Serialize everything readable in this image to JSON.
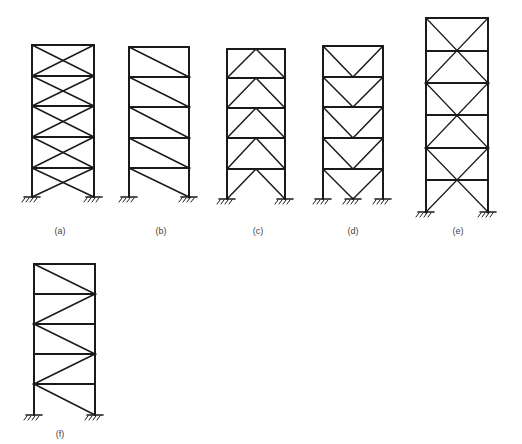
{
  "figure": {
    "stroke_color": "#1a1a1a",
    "label_color": "#444444",
    "frames": [
      {
        "id": "a",
        "label": "(a)",
        "bracing": "x-brace (cross) every story",
        "left_x": 32,
        "right_x": 94,
        "levels_y": [
          45,
          76,
          106,
          137,
          168,
          197
        ],
        "supports_x": [
          32,
          94
        ],
        "label_pos": [
          60,
          234
        ]
      },
      {
        "id": "b",
        "label": "(b)",
        "bracing": "single diagonal every story (top-left to bottom-right)",
        "left_x": 129,
        "right_x": 189,
        "levels_y": [
          47,
          77,
          107,
          138,
          168,
          197
        ],
        "supports_x": [
          129,
          189
        ],
        "label_pos": [
          161,
          234
        ]
      },
      {
        "id": "c",
        "label": "(c)",
        "bracing": "inverted-V (chevron) every story",
        "left_x": 227,
        "right_x": 285,
        "levels_y": [
          49,
          78,
          108,
          138,
          169,
          199
        ],
        "supports_x": [
          227,
          285
        ],
        "label_pos": [
          258,
          234
        ]
      },
      {
        "id": "d",
        "label": "(d)",
        "bracing": "V-brace in upper stories, inverted-V in bottom story",
        "left_x": 323,
        "right_x": 383,
        "levels_y": [
          46,
          77,
          107,
          138,
          169,
          199
        ],
        "supports_x": [
          323,
          353,
          383
        ],
        "label_pos": [
          353,
          234
        ]
      },
      {
        "id": "e",
        "label": "(e)",
        "bracing": "two-story X-brace",
        "left_x": 426,
        "right_x": 488,
        "levels_y": [
          18,
          51,
          83,
          115,
          148,
          180,
          212
        ],
        "supports_x": [
          426,
          488
        ],
        "label_pos": [
          458,
          234
        ]
      },
      {
        "id": "f",
        "label": "(f)",
        "bracing": "zig-zag single diagonals",
        "left_x": 34,
        "right_x": 95,
        "levels_y": [
          264,
          294,
          324,
          354,
          384,
          415
        ],
        "supports_x": [
          34,
          95
        ],
        "label_pos": [
          60,
          437
        ]
      }
    ]
  }
}
